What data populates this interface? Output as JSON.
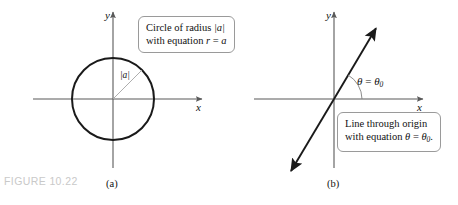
{
  "figure": {
    "caption": "FIGURE 10.22",
    "caption_color": "#c9c9c9",
    "width": 458,
    "height": 205,
    "background": "#ffffff",
    "stroke_color": "#1a1a1a",
    "axis_color": "#595959",
    "thin_line_color": "#9a9a9a",
    "callout_border_color": "#9a9a9a"
  },
  "panel_a": {
    "label": "(a)",
    "axis_x_label": "x",
    "axis_y_label": "y",
    "radius_label": "|a|",
    "callout": {
      "line1_prefix": "Circle of radius ",
      "line1_math": "|a|",
      "line2_prefix": "with equation ",
      "line2_var": "r",
      "line2_eq": " = ",
      "line2_val": "a"
    },
    "geometry": {
      "origin_x": 113,
      "origin_y": 99,
      "circle_radius": 41,
      "x_axis_start": 33,
      "x_axis_end": 202,
      "y_axis_top": 12,
      "y_axis_bottom": 168,
      "radius_angle_deg": 45
    }
  },
  "panel_b": {
    "label": "(b)",
    "axis_x_label": "x",
    "axis_y_label": "y",
    "angle_label_theta": "θ",
    "angle_label_eq": " = ",
    "angle_label_theta0": "θ",
    "angle_label_sub": "0",
    "callout": {
      "line1": "Line through origin",
      "line2_prefix": "with equation ",
      "line2_theta": "θ",
      "line2_eq": " = ",
      "line2_theta0": "θ",
      "line2_sub": "0",
      "line2_period": "."
    },
    "geometry": {
      "origin_x": 334,
      "origin_y": 99,
      "x_axis_start": 254,
      "x_axis_end": 423,
      "y_axis_top": 12,
      "y_axis_bottom": 168,
      "line_angle_deg": 60,
      "line_tip_upper_x": 377,
      "line_tip_upper_y": 27,
      "line_tip_lower_x": 290,
      "line_tip_lower_y": 172,
      "arc_radius": 28
    }
  }
}
